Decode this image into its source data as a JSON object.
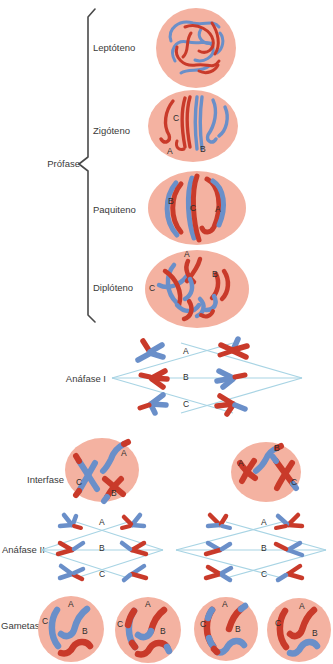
{
  "palette": {
    "background": "#ffffff",
    "cell_fill": "#f4b2a1",
    "chromosome_red": "#c93a2a",
    "chromosome_blue": "#6a8fc9",
    "spindle_blue": "#a8d4e4",
    "text_color": "#3a3a3a",
    "brace_color": "#4a4a4a"
  },
  "profase": {
    "label": "Prófase",
    "stages": {
      "leptoteno": {
        "label": "Leptóteno"
      },
      "zigoteno": {
        "label": "Zigóteno",
        "markers": {
          "c": "C",
          "a": "A",
          "b": "B"
        }
      },
      "paquiteno": {
        "label": "Paquiteno",
        "markers": {
          "b": "B",
          "c": "C",
          "a": "A"
        }
      },
      "diploteno": {
        "label": "Diplóteno",
        "markers": {
          "a": "A",
          "b": "B",
          "c": "C"
        }
      }
    }
  },
  "anafase_i": {
    "label": "Anáfase I",
    "markers": {
      "a": "A",
      "b": "B",
      "c": "C"
    }
  },
  "interfase": {
    "label": "Interfase",
    "left_cell": {
      "markers": {
        "a": "A",
        "c": "C",
        "b": "B"
      }
    },
    "right_cell": {
      "markers": {
        "b": "B",
        "a": "A",
        "c": "C"
      }
    }
  },
  "anafase_ii": {
    "label": "Anáfase II",
    "left_spindle": {
      "markers": {
        "a": "A",
        "b": "B",
        "c": "C"
      }
    },
    "right_spindle": {
      "markers": {
        "a": "A",
        "b": "B",
        "c": "C"
      }
    }
  },
  "gametas": {
    "label": "Gametas",
    "cells": [
      {
        "markers": {
          "c": "C",
          "a": "A",
          "b": "B"
        }
      },
      {
        "markers": {
          "c": "C",
          "a": "A",
          "b": "B"
        }
      },
      {
        "markers": {
          "c": "C",
          "a": "A",
          "b": "B"
        }
      },
      {
        "markers": {
          "c": "C",
          "a": "A",
          "b": "B"
        }
      }
    ]
  }
}
